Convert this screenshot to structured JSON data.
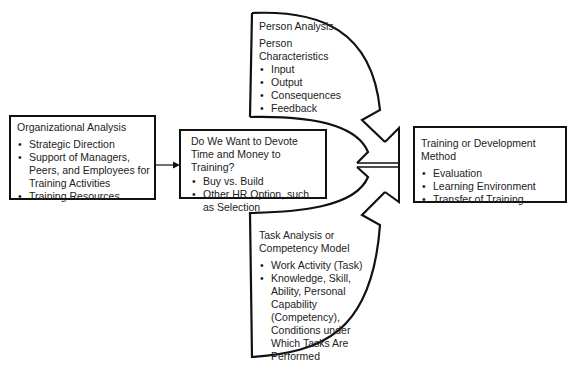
{
  "diagram": {
    "organizational_analysis": {
      "title": "Organizational Analysis",
      "items": [
        "Strategic Direction",
        "Support of Managers, Peers, and Employees for Training Activities",
        "Training Resources"
      ]
    },
    "decision": {
      "title": "Do We Want to Devote Time and Money to Training?",
      "items": [
        "Buy vs. Build",
        "Other HR Option, such as Selection"
      ]
    },
    "person_analysis": {
      "title": "Person Analysis",
      "subtitle": "Person Characteristics",
      "items": [
        "Input",
        "Output",
        "Consequences",
        "Feedback"
      ]
    },
    "task_analysis": {
      "title": "Task Analysis or Competency Model",
      "items": [
        "Work Activity (Task)",
        "Knowledge, Skill, Ability, Personal Capability (Competency), Conditions under Which Tasks Are Performed"
      ]
    },
    "training_method": {
      "title": "Training or Development Method",
      "items": [
        "Evaluation",
        "Learning Environment",
        "Transfer of Training"
      ]
    }
  }
}
